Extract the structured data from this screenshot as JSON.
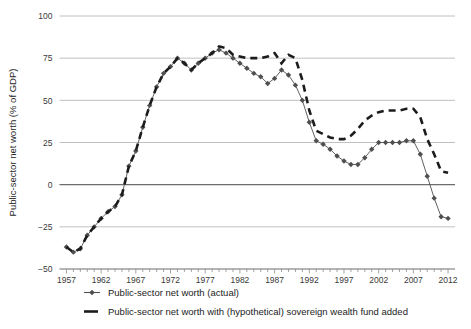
{
  "chart_data": {
    "type": "line",
    "title": "",
    "xlabel": "",
    "ylabel": "Public-sector net worth (% of GDP)",
    "xlim": [
      1956,
      2013
    ],
    "ylim": [
      -50,
      100
    ],
    "yticks": [
      -50,
      -25,
      0,
      25,
      50,
      75,
      100
    ],
    "ytick_labels": [
      "−50",
      "−25",
      "0",
      "25",
      "50",
      "75",
      "100"
    ],
    "xticks": [
      1957,
      1962,
      1967,
      1972,
      1977,
      1982,
      1987,
      1992,
      1997,
      2002,
      2007,
      2012
    ],
    "xtick_labels": [
      "1957",
      "1962",
      "1967",
      "1972",
      "1977",
      "1982",
      "1987",
      "1992",
      "1997",
      "2002",
      "2007",
      "2012"
    ],
    "minor_xtick_interval": 1,
    "grid": "horizontal",
    "legend_position": "bottom-left",
    "x": [
      1957,
      1958,
      1959,
      1960,
      1961,
      1962,
      1963,
      1964,
      1965,
      1966,
      1967,
      1968,
      1969,
      1970,
      1971,
      1972,
      1973,
      1974,
      1975,
      1976,
      1977,
      1978,
      1979,
      1980,
      1981,
      1982,
      1983,
      1984,
      1985,
      1986,
      1987,
      1988,
      1989,
      1990,
      1991,
      1992,
      1993,
      1994,
      1995,
      1996,
      1997,
      1998,
      1999,
      2000,
      2001,
      2002,
      2003,
      2004,
      2005,
      2006,
      2007,
      2008,
      2009,
      2010,
      2011,
      2012
    ],
    "series": [
      {
        "name": "Public-sector net worth (actual)",
        "style": "solid-with-markers",
        "marker": "diamond",
        "color": "#4f4f4f",
        "values": [
          -37,
          -40,
          -38,
          -30,
          -25,
          -20,
          -16,
          -13,
          -6,
          11,
          20,
          34,
          47,
          58,
          66,
          70,
          75,
          72,
          68,
          72,
          75,
          78,
          80,
          78,
          75,
          72,
          69,
          66,
          64,
          60,
          63,
          68,
          65,
          59,
          50,
          37,
          26,
          24,
          21,
          17,
          14,
          12,
          12,
          16,
          21,
          25,
          25,
          25,
          25,
          26,
          26,
          18,
          5,
          -8,
          -19,
          -20
        ]
      },
      {
        "name": "Public-sector net worth with (hypothetical) sovereign wealth fund added",
        "style": "dashed",
        "marker": "none",
        "color": "#1c1c1c",
        "values": [
          -37,
          -40,
          -38,
          -30,
          -25,
          -20,
          -16,
          -13,
          -6,
          11,
          20,
          34,
          47,
          58,
          66,
          70,
          75,
          72,
          68,
          72,
          75,
          78,
          82,
          81,
          77,
          76,
          75,
          75,
          75,
          76,
          78,
          72,
          77,
          75,
          62,
          44,
          32,
          30,
          28,
          27,
          27,
          29,
          33,
          38,
          41,
          43,
          44,
          44,
          44,
          45,
          45,
          40,
          27,
          18,
          8,
          7
        ]
      }
    ]
  },
  "legend": {
    "items": [
      {
        "label": "Public-sector net worth (actual)",
        "marker": "diamond-line"
      },
      {
        "label": "Public-sector net worth with (hypothetical) sovereign wealth fund added",
        "marker": "dash"
      }
    ]
  }
}
